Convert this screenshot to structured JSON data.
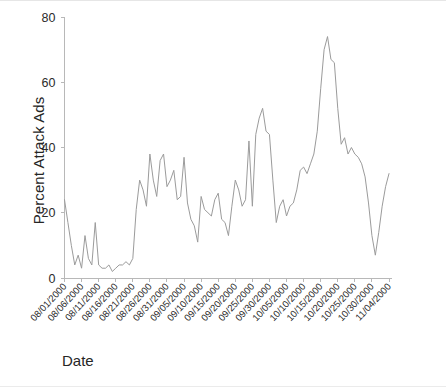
{
  "chart_data": {
    "type": "line",
    "title": "",
    "xlabel": "Date",
    "ylabel": "Percent Attack Ads",
    "ylim": [
      0,
      80
    ],
    "yticks": [
      0,
      20,
      40,
      60,
      80
    ],
    "grid": false,
    "legend": null,
    "x_start": "08/01/2000",
    "x_end": "11/04/2000",
    "xtick_interval_days": 5,
    "xticklabels": [
      "08/01/2000",
      "08/06/2000",
      "08/11/2000",
      "08/16/2000",
      "08/21/2000",
      "08/26/2000",
      "08/31/2000",
      "09/05/2000",
      "09/10/2000",
      "09/15/2000",
      "09/20/2000",
      "09/25/2000",
      "09/30/2000",
      "10/05/2000",
      "10/10/2000",
      "10/15/2000",
      "10/20/2000",
      "10/25/2000",
      "10/30/2000",
      "11/04/2000"
    ],
    "series": [
      {
        "name": "Percent Attack Ads",
        "color": "#9b9b9b",
        "x": [
          "08/01/2000",
          "08/02/2000",
          "08/03/2000",
          "08/04/2000",
          "08/05/2000",
          "08/06/2000",
          "08/07/2000",
          "08/08/2000",
          "08/09/2000",
          "08/10/2000",
          "08/11/2000",
          "08/12/2000",
          "08/13/2000",
          "08/14/2000",
          "08/15/2000",
          "08/16/2000",
          "08/17/2000",
          "08/18/2000",
          "08/19/2000",
          "08/20/2000",
          "08/21/2000",
          "08/22/2000",
          "08/23/2000",
          "08/24/2000",
          "08/25/2000",
          "08/26/2000",
          "08/27/2000",
          "08/28/2000",
          "08/29/2000",
          "08/30/2000",
          "08/31/2000",
          "09/01/2000",
          "09/02/2000",
          "09/03/2000",
          "09/04/2000",
          "09/05/2000",
          "09/06/2000",
          "09/07/2000",
          "09/08/2000",
          "09/09/2000",
          "09/10/2000",
          "09/11/2000",
          "09/12/2000",
          "09/13/2000",
          "09/14/2000",
          "09/15/2000",
          "09/16/2000",
          "09/17/2000",
          "09/18/2000",
          "09/19/2000",
          "09/20/2000",
          "09/21/2000",
          "09/22/2000",
          "09/23/2000",
          "09/24/2000",
          "09/25/2000",
          "09/26/2000",
          "09/27/2000",
          "09/28/2000",
          "09/29/2000",
          "09/30/2000",
          "10/01/2000",
          "10/02/2000",
          "10/03/2000",
          "10/04/2000",
          "10/05/2000",
          "10/06/2000",
          "10/07/2000",
          "10/08/2000",
          "10/09/2000",
          "10/10/2000",
          "10/11/2000",
          "10/12/2000",
          "10/13/2000",
          "10/14/2000",
          "10/15/2000",
          "10/16/2000",
          "10/17/2000",
          "10/18/2000",
          "10/19/2000",
          "10/20/2000",
          "10/21/2000",
          "10/22/2000",
          "10/23/2000",
          "10/24/2000",
          "10/25/2000",
          "10/26/2000",
          "10/27/2000",
          "10/28/2000",
          "10/29/2000",
          "10/30/2000",
          "10/31/2000",
          "11/01/2000",
          "11/02/2000",
          "11/03/2000",
          "11/04/2000"
        ],
        "values": [
          24,
          17,
          10,
          4,
          7,
          3,
          13,
          6,
          4,
          17,
          4,
          3,
          3,
          4,
          2,
          3,
          4,
          4,
          5,
          4,
          6,
          21,
          30,
          27,
          22,
          38,
          30,
          25,
          36,
          38,
          28,
          30,
          33,
          24,
          25,
          37,
          23,
          18,
          16,
          11,
          25,
          21,
          20,
          19,
          24,
          26,
          18,
          17,
          13,
          22,
          30,
          27,
          22,
          24,
          42,
          22,
          44,
          49,
          52,
          45,
          44,
          30,
          17,
          22,
          24,
          19,
          22,
          23,
          27,
          33,
          34,
          32,
          35,
          38,
          45,
          58,
          70,
          74,
          67,
          66,
          52,
          41,
          43,
          38,
          40,
          38,
          37,
          35,
          31,
          23,
          13,
          7,
          14,
          22,
          28,
          32
        ]
      }
    ]
  },
  "axis": {
    "y_title": "Percent Attack Ads",
    "x_title": "Date"
  }
}
